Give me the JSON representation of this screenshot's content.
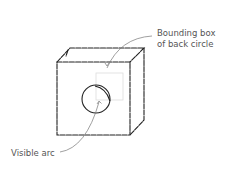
{
  "diagram": {
    "labels": {
      "bounding_box_line1": "Bounding box",
      "bounding_box_line2": "of back circle",
      "visible_arc": "Visible arc"
    },
    "colors": {
      "stroke": "#222222",
      "box": "#dddddd",
      "text": "#555555"
    }
  }
}
